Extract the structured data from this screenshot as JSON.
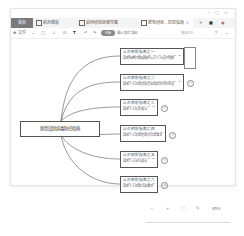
{
  "window": {
    "controls": [
      "minimize",
      "maximize",
      "close"
    ]
  },
  "tabs": [
    {
      "label": "首页",
      "type": "home"
    },
    {
      "label": "稻壳模板",
      "icon": "template-icon"
    },
    {
      "label": "如何绘制思维导图",
      "icon": "mindmap-file-icon"
    },
    {
      "label": "新型冠状...防控指南",
      "icon": "mindmap-file-icon",
      "active": true
    }
  ],
  "tabbar_actions": {
    "close": "×",
    "add": "+",
    "apps": "■",
    "user": "◉"
  },
  "toolbar": {
    "file_menu": "≡ 文件",
    "file_chevron": "⌄",
    "icons": [
      "save-icon",
      "print-icon",
      "export-icon",
      "format-painter-icon",
      "undo-icon",
      "redo-icon"
    ],
    "start_pill": "开始",
    "insert_label": "插入 样式 导出",
    "search_placeholder": "查找命令",
    "help": "?",
    "collapse": "⌄"
  },
  "mindmap": {
    "root": "新型冠状病毒防控指南",
    "nodes": [
      {
        "title": "公众预防指南之一",
        "desc": "居家隔离时需要做的公众个人防护措施",
        "badge": "①"
      },
      {
        "title": "公众预防指南之二",
        "desc": "居家个人及家庭成员出现症状时的处置",
        "badge": "②"
      },
      {
        "title": "公众预防指南之三",
        "desc": "居家个人防护要点",
        "badge": "③"
      },
      {
        "title": "公众预防指南之四",
        "desc": "居家个人及家庭成员日常清洁",
        "badge": "④"
      },
      {
        "title": "公众预防指南之五",
        "desc": "居家个人出行要点",
        "badge": "⑤"
      },
      {
        "title": "公众预防指南之六",
        "desc": "居家个人就医注意事项",
        "badge": "⑥"
      }
    ]
  },
  "zoom_controls": {
    "minus": "−",
    "plus": "+",
    "fit": "⛶",
    "search": "🔍",
    "percent": "85%"
  }
}
